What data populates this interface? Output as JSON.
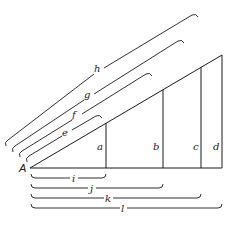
{
  "diagram": {
    "title": "",
    "vertex_label": "A",
    "vertical_segments": [
      {
        "label": "a"
      },
      {
        "label": "b"
      },
      {
        "label": "c"
      },
      {
        "label": "d"
      }
    ],
    "hypotenuse_brackets": [
      {
        "label": "e"
      },
      {
        "label": "f"
      },
      {
        "label": "g"
      },
      {
        "label": "h"
      }
    ],
    "base_brackets": [
      {
        "label": "i"
      },
      {
        "label": "j"
      },
      {
        "label": "k"
      },
      {
        "label": "l"
      }
    ],
    "colors": {
      "stroke": "#1a1a1a",
      "background": "#ffffff"
    }
  }
}
